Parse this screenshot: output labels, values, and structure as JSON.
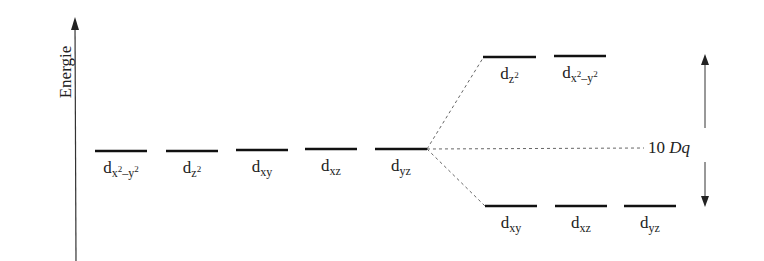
{
  "diagram": {
    "type": "crystal-field-splitting",
    "axis_label": "Energie",
    "split_label": {
      "number": "10",
      "symbol": "Dq"
    },
    "degenerate_orbitals": [
      {
        "base": "d",
        "sub": "x",
        "sup": "2",
        "sub2": "–y",
        "sup2": "2",
        "x1": 95,
        "x2": 147,
        "y": 151
      },
      {
        "base": "d",
        "sub": "z",
        "sup": "2",
        "x1": 166,
        "x2": 218,
        "y": 151
      },
      {
        "base": "d",
        "sub": "xy",
        "x1": 236,
        "x2": 288,
        "y": 150
      },
      {
        "base": "d",
        "sub": "xz",
        "x1": 305,
        "x2": 357,
        "y": 149
      },
      {
        "base": "d",
        "sub": "yz",
        "x1": 375,
        "x2": 427,
        "y": 149
      }
    ],
    "eg_orbitals": [
      {
        "base": "d",
        "sub": "z",
        "sup": "2",
        "x1": 483,
        "x2": 536,
        "y": 57
      },
      {
        "base": "d",
        "sub": "x",
        "sup": "2",
        "sub2": "–y",
        "sup2": "2",
        "x1": 554,
        "x2": 606,
        "y": 56
      }
    ],
    "t2g_orbitals": [
      {
        "base": "d",
        "sub": "xy",
        "x1": 485,
        "x2": 537,
        "y": 206
      },
      {
        "base": "d",
        "sub": "xz",
        "x1": 555,
        "x2": 607,
        "y": 206
      },
      {
        "base": "d",
        "sub": "yz",
        "x1": 624,
        "x2": 676,
        "y": 206
      }
    ]
  }
}
